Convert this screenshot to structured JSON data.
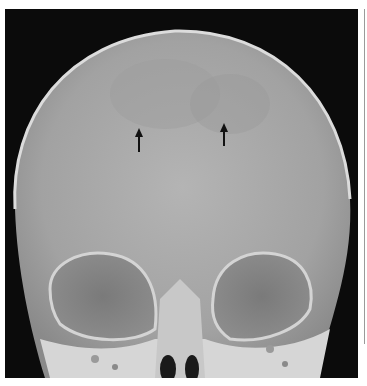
{
  "figure": {
    "annotations": [
      {
        "type": "arrow",
        "direction": "up",
        "x": 139,
        "y_top": 129,
        "y_bottom": 152
      },
      {
        "type": "arrow",
        "direction": "up",
        "x": 224,
        "y_top": 124,
        "y_bottom": 146
      }
    ],
    "colors": {
      "background": "#0b0b0b",
      "bone": "#d8d8d8",
      "vault": "#a9a9a9",
      "orbit": "#7e7e7e",
      "arrow": "#111111"
    }
  }
}
